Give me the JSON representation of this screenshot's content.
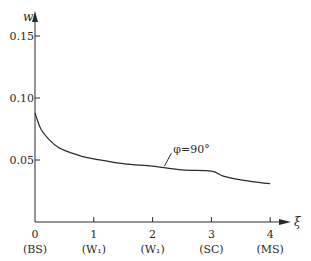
{
  "chart_data": {
    "type": "line",
    "title": "",
    "xlabel": "ξ",
    "ylabel": "w",
    "xlim": [
      0,
      4
    ],
    "ylim": [
      0,
      0.17
    ],
    "grid": false,
    "legend": null,
    "x_ticks": [
      {
        "value": 0,
        "label": "0",
        "sublabel": "(BS)"
      },
      {
        "value": 1,
        "label": "1",
        "sublabel": "(W₁)"
      },
      {
        "value": 2,
        "label": "2",
        "sublabel": "(W₁)"
      },
      {
        "value": 3,
        "label": "3",
        "sublabel": "(SC)"
      },
      {
        "value": 4,
        "label": "4",
        "sublabel": "(MS)"
      }
    ],
    "y_ticks": [
      {
        "value": 0.05,
        "label": "0.05"
      },
      {
        "value": 0.1,
        "label": "0.10"
      },
      {
        "value": 0.15,
        "label": "0.15"
      }
    ],
    "series": [
      {
        "name": "φ=90°",
        "x": [
          0,
          0.1,
          0.25,
          0.4,
          0.6,
          0.8,
          1.0,
          1.5,
          2.0,
          2.5,
          3.0,
          3.2,
          3.5,
          3.8,
          4.0
        ],
        "y": [
          0.088,
          0.075,
          0.066,
          0.06,
          0.056,
          0.053,
          0.051,
          0.047,
          0.045,
          0.042,
          0.041,
          0.037,
          0.034,
          0.032,
          0.031
        ]
      }
    ],
    "annotations": [
      {
        "text": "φ=90°",
        "x": 2.2,
        "y": 0.045
      }
    ]
  }
}
